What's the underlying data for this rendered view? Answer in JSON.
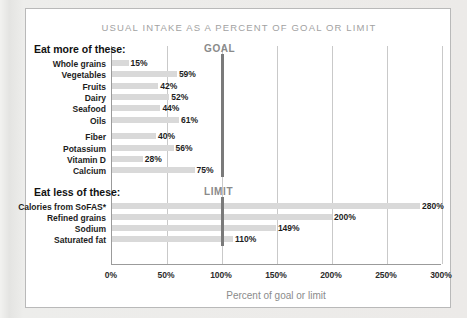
{
  "chart_data": {
    "type": "bar",
    "orientation": "horizontal",
    "title": "USUAL INTAKE AS A PERCENT OF GOAL OR LIMIT",
    "xlabel": "Percent of goal or limit",
    "ylabel": "",
    "xlim": [
      0,
      300
    ],
    "xticks": [
      "0%",
      "50%",
      "100%",
      "150%",
      "200%",
      "250%",
      "300%"
    ],
    "xtick_values": [
      0,
      50,
      100,
      150,
      200,
      250,
      300
    ],
    "grid": true,
    "legend": "none",
    "reference_lines": [
      {
        "label": "GOAL",
        "value": 100,
        "section": "eat_more"
      },
      {
        "label": "LIMIT",
        "value": 100,
        "section": "eat_less"
      }
    ],
    "sections": [
      {
        "heading": "Eat more of these:",
        "marker": "GOAL",
        "groups": [
          {
            "categories": [
              "Whole grains",
              "Vegetables",
              "Fruits",
              "Dairy",
              "Seafood",
              "Oils"
            ],
            "values": [
              15,
              59,
              42,
              52,
              44,
              61
            ],
            "labels": [
              "15%",
              "59%",
              "42%",
              "52%",
              "44%",
              "61%"
            ]
          },
          {
            "categories": [
              "Fiber",
              "Potassium",
              "Vitamin D",
              "Calcium"
            ],
            "values": [
              40,
              56,
              28,
              75
            ],
            "labels": [
              "40%",
              "56%",
              "28%",
              "75%"
            ]
          }
        ]
      },
      {
        "heading": "Eat less of these:",
        "marker": "LIMIT",
        "groups": [
          {
            "categories": [
              "Calories from SoFAS*",
              "Refined grains",
              "Sodium",
              "Saturated fat"
            ],
            "values": [
              280,
              200,
              149,
              110
            ],
            "labels": [
              "280%",
              "200%",
              "149%",
              "110%"
            ]
          }
        ]
      }
    ],
    "categories": [
      "Whole grains",
      "Vegetables",
      "Fruits",
      "Dairy",
      "Seafood",
      "Oils",
      "Fiber",
      "Potassium",
      "Vitamin D",
      "Calcium",
      "Calories from SoFAS*",
      "Refined grains",
      "Sodium",
      "Saturated fat"
    ],
    "values": [
      15,
      59,
      42,
      52,
      44,
      61,
      40,
      56,
      28,
      75,
      280,
      200,
      149,
      110
    ],
    "colors": {
      "bar": "#d9d9d9",
      "reference_line": "#7a7a7a",
      "gridline": "#c9c9c9",
      "title": "#a2a2a2",
      "text": "#1d1d1d",
      "panel_background": "#ffffff",
      "page_background": "#e9e9e7"
    }
  }
}
